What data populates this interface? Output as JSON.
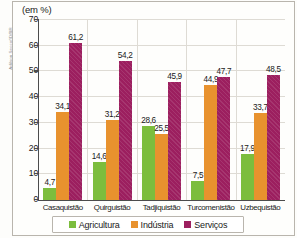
{
  "credit": "Adilson Secco/ID/BR",
  "units_title": "(em %)",
  "chart_data": {
    "type": "bar",
    "title": "(em %)",
    "xlabel": "",
    "ylabel": "",
    "ylim": [
      0,
      70
    ],
    "yticks": [
      0,
      10,
      20,
      30,
      40,
      50,
      60,
      70
    ],
    "ytick_labels": [
      "0",
      "10",
      "20",
      "30",
      "40",
      "50",
      "60",
      "70"
    ],
    "grid": true,
    "legend_position": "bottom",
    "categories": [
      "Casaquistão",
      "Quirguistão",
      "Tadjiquistão",
      "Turcomenistão",
      "Uzbequistão"
    ],
    "series": [
      {
        "name": "Agricultura",
        "color": "#7cbd3d",
        "values": [
          4.7,
          14.6,
          28.6,
          7.5,
          17.9
        ],
        "labels": [
          "4,7",
          "14,6",
          "28,6",
          "7,5",
          "17,9"
        ]
      },
      {
        "name": "Indústria",
        "color": "#e8922e",
        "values": [
          34.1,
          31.2,
          25.5,
          44.9,
          33.7
        ],
        "labels": [
          "34,1",
          "31,2",
          "25,5",
          "44,9",
          "33,7"
        ]
      },
      {
        "name": "Serviços",
        "color": "#9c1f5f",
        "values": [
          61.2,
          54.2,
          45.9,
          47.7,
          48.5
        ],
        "labels": [
          "61,2",
          "54,2",
          "45,9",
          "47,7",
          "48,5"
        ]
      }
    ]
  }
}
